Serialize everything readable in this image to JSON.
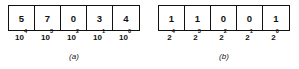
{
  "figure": {
    "panels": [
      {
        "id": "panel-a",
        "caption": "(a)",
        "base": 10,
        "digits": [
          "5",
          "7",
          "0",
          "3",
          "4"
        ],
        "weights": [
          {
            "base": "10",
            "exponent": "4"
          },
          {
            "base": "10",
            "exponent": "3"
          },
          {
            "base": "10",
            "exponent": "2"
          },
          {
            "base": "10",
            "exponent": "1"
          },
          {
            "base": "10",
            "exponent": "0"
          }
        ]
      },
      {
        "id": "panel-b",
        "caption": "(b)",
        "base": 2,
        "digits": [
          "1",
          "1",
          "0",
          "0",
          "1"
        ],
        "weights": [
          {
            "base": "2",
            "exponent": "4"
          },
          {
            "base": "2",
            "exponent": "3"
          },
          {
            "base": "2",
            "exponent": "2"
          },
          {
            "base": "2",
            "exponent": "1"
          },
          {
            "base": "2",
            "exponent": "0"
          }
        ]
      }
    ],
    "colors": {
      "ink": "#111111",
      "background": "#ffffff"
    }
  }
}
